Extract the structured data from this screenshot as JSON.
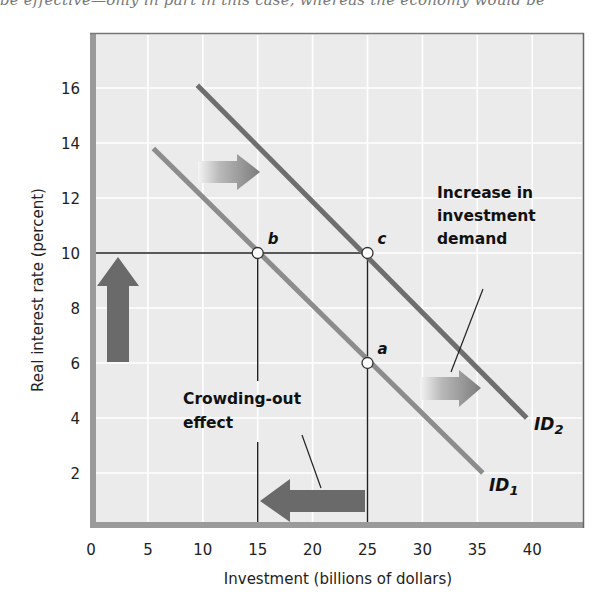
{
  "caption_fragment": "be effective—only in part in this case, whereas the economy would be",
  "chart_data": {
    "type": "line",
    "title": "",
    "xlabel": "Investment (billions of dollars)",
    "ylabel": "Real interest rate (percent)",
    "xlim": [
      0,
      45
    ],
    "ylim": [
      0,
      18
    ],
    "x_ticks": [
      0,
      5,
      10,
      15,
      20,
      25,
      30,
      35,
      40
    ],
    "y_ticks": [
      2,
      4,
      6,
      8,
      10,
      12,
      14,
      16
    ],
    "grid": true,
    "series": [
      {
        "name": "ID1",
        "label_main": "ID",
        "label_sub": "1",
        "color": "#8c8c8c",
        "points": [
          [
            5.5,
            13.8
          ],
          [
            35.5,
            2.0
          ]
        ]
      },
      {
        "name": "ID2",
        "label_main": "ID",
        "label_sub": "2",
        "color": "#6e6e6e",
        "points": [
          [
            9.5,
            16.1
          ],
          [
            39.5,
            4.0
          ]
        ]
      }
    ],
    "points": [
      {
        "label": "b",
        "x": 15,
        "y": 10
      },
      {
        "label": "c",
        "x": 25,
        "y": 10
      },
      {
        "label": "a",
        "x": 25,
        "y": 6
      }
    ],
    "guide_lines": [
      {
        "from": [
          0,
          10
        ],
        "to": [
          25,
          10
        ]
      },
      {
        "from": [
          15,
          10
        ],
        "to": [
          15,
          0
        ]
      },
      {
        "from": [
          25,
          10
        ],
        "to": [
          25,
          0
        ]
      }
    ],
    "annotations": [
      {
        "id": "increase",
        "lines": [
          "Increase in",
          "investment",
          "demand"
        ]
      },
      {
        "id": "crowding",
        "lines": [
          "Crowding-out",
          "effect"
        ]
      }
    ],
    "arrows": [
      {
        "name": "shift-right-upper",
        "direction": "right",
        "style": "gradient"
      },
      {
        "name": "shift-right-lower",
        "direction": "right",
        "style": "gradient"
      },
      {
        "name": "interest-rate-rise",
        "direction": "up",
        "style": "solid"
      },
      {
        "name": "crowding-out-decrease",
        "direction": "left",
        "style": "solid"
      }
    ],
    "colors": {
      "plot_bg": "#ebebeb",
      "grid": "#ffffff",
      "frame_shadow": "#9a9a9a",
      "solid_arrow": "#6a6a6a"
    }
  }
}
